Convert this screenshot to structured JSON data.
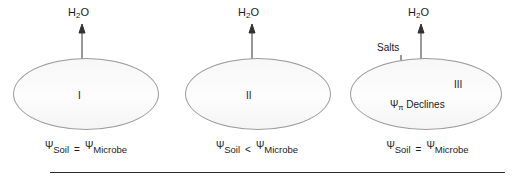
{
  "figure": {
    "background_color": "#ffffff",
    "ellipse_fill": "#fbfbfb",
    "ellipse_stroke": "#9a9a9a",
    "arrow_color": "#333333",
    "text_color": "#1a1a1a",
    "rule_color": "#2b2b2b"
  },
  "panels": [
    {
      "id": "I",
      "roman_label": "I",
      "flux_label": "H",
      "flux_label_sub": "2",
      "flux_label_tail": "O",
      "arrow_type": "double-headed-vertical",
      "arrow_direction": "bidirectional",
      "caption": {
        "left_symbol": "Ψ",
        "left_subscript": "Soil",
        "operator": "=",
        "right_symbol": "Ψ",
        "right_subscript": "Microbe"
      }
    },
    {
      "id": "II",
      "roman_label": "II",
      "flux_label": "H",
      "flux_label_sub": "2",
      "flux_label_tail": "O",
      "arrow_type": "single-headed-vertical",
      "arrow_direction": "up",
      "caption": {
        "left_symbol": "Ψ",
        "left_subscript": "Soil",
        "operator": "<",
        "right_symbol": "Ψ",
        "right_subscript": "Microbe"
      }
    },
    {
      "id": "III",
      "roman_label": "III",
      "flux_label": "H",
      "flux_label_sub": "2",
      "flux_label_tail": "O",
      "arrow_type": "double-headed-vertical",
      "arrow_direction": "bidirectional",
      "solute_label": "Salts",
      "solute_arrow_direction": "down",
      "interior_note_symbol": "Ψ",
      "interior_note_subscript": "π",
      "interior_note_text": " Declines",
      "caption": {
        "left_symbol": "Ψ",
        "left_subscript": "Soil",
        "operator": "=",
        "right_symbol": "Ψ",
        "right_subscript": "Microbe"
      }
    }
  ]
}
